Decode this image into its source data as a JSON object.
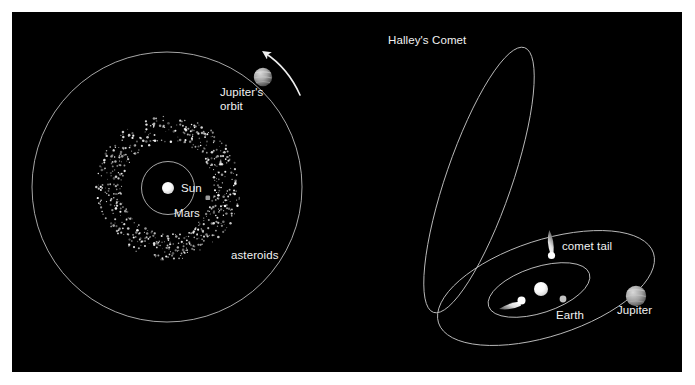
{
  "figure": {
    "background_color": "#ffffff",
    "panel_color": "#000000",
    "label_color": "#f2f2f2",
    "orbit_color": "#b9b9b9",
    "type": "astronomy-diagram",
    "panel_count": 2
  },
  "left_panel": {
    "name": "inner-solar-system-asteroid-belt",
    "labels": {
      "sun": "Sun",
      "mars": "Mars",
      "asteroids": "asteroids",
      "jupiters_orbit_line1": "Jupiter's",
      "jupiters_orbit_line2": "orbit"
    },
    "bodies": [
      {
        "name": "sun",
        "label": "Sun",
        "color": "#ffffff",
        "radius_px": 6
      },
      {
        "name": "mars",
        "label": "Mars",
        "color": "#9a9a9a",
        "radius_px": 2.4
      },
      {
        "name": "jupiter",
        "label": "Jupiter",
        "color": "#b6b6b6",
        "radius_px": 9
      }
    ],
    "orbits": [
      {
        "name": "mars-orbit",
        "radius_px": 26,
        "shape": "circle"
      },
      {
        "name": "asteroid-belt",
        "inner_radius_px": 46,
        "outer_radius_px": 72,
        "shape": "annulus"
      },
      {
        "name": "jupiter-orbit",
        "radius_px": 135,
        "shape": "circle"
      }
    ],
    "direction_arrow": {
      "name": "orbit-direction-arrow",
      "direction": "counterclockwise"
    },
    "asteroid_count": 620
  },
  "right_panel": {
    "name": "halleys-comet-orbit",
    "labels": {
      "halleys_comet": "Halley's Comet",
      "comet_tail": "comet tail",
      "earth": "Earth",
      "jupiter": "Jupiter"
    },
    "bodies": [
      {
        "name": "sun",
        "color": "#ffffff",
        "radius_px": 7
      },
      {
        "name": "earth",
        "label": "Earth",
        "color": "#bdbdbd",
        "radius_px": 3.2
      },
      {
        "name": "jupiter",
        "label": "Jupiter",
        "color": "#b0b0b0",
        "radius_px": 10
      },
      {
        "name": "comet-far",
        "label": "comet tail",
        "color": "#f5f5f5"
      },
      {
        "name": "comet-near",
        "color": "#f5f5f5"
      }
    ],
    "orbits": [
      {
        "name": "halleys-comet-orbit",
        "shape": "ellipse",
        "eccentricity": "high",
        "tilt_deg": 35
      },
      {
        "name": "jupiter-orbit",
        "shape": "ellipse",
        "tilt_deg": -22
      },
      {
        "name": "earth-orbit",
        "shape": "ellipse",
        "tilt_deg": -22
      }
    ]
  }
}
